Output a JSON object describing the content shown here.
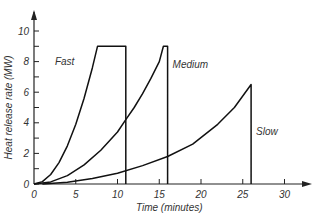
{
  "chart_data": {
    "type": "line",
    "title": "",
    "xlabel": "Time (minutes)",
    "ylabel": "Heat release rate (MW)",
    "xlim": [
      0,
      33
    ],
    "ylim": [
      0,
      11
    ],
    "x_ticks": [
      0,
      5,
      10,
      15,
      20,
      25,
      30
    ],
    "x_tick_labels": [
      "0",
      "5",
      "10",
      "15",
      "20",
      "25",
      "30"
    ],
    "y_ticks": [
      0,
      2,
      4,
      6,
      8,
      10
    ],
    "y_tick_labels": [
      "0",
      "2",
      "4",
      "6",
      "8",
      "10"
    ],
    "y_minor_ticks": [
      1,
      3,
      5,
      7,
      9
    ],
    "grid": false,
    "legend": "inline labels",
    "series": [
      {
        "name": "Fast",
        "label_pos": {
          "x": 2.5,
          "y": 7.8
        },
        "x": [
          0,
          1,
          2,
          3,
          4,
          5,
          6,
          7,
          7.6,
          11,
          11
        ],
        "values": [
          0,
          0.16,
          0.62,
          1.4,
          2.5,
          3.9,
          5.6,
          7.6,
          9,
          9,
          0
        ]
      },
      {
        "name": "Medium",
        "label_pos": {
          "x": 16.6,
          "y": 7.6
        },
        "x": [
          0,
          2,
          4,
          6,
          8,
          10,
          11,
          12,
          13,
          14,
          15,
          15.5,
          16,
          16
        ],
        "values": [
          0,
          0.14,
          0.55,
          1.25,
          2.2,
          3.4,
          4.2,
          5.0,
          5.9,
          6.9,
          8.0,
          9,
          9,
          0
        ]
      },
      {
        "name": "Slow",
        "label_pos": {
          "x": 26.6,
          "y": 3.2
        },
        "x": [
          1,
          4,
          7,
          10,
          13,
          16,
          19,
          22,
          24,
          26,
          26
        ],
        "values": [
          0,
          0.12,
          0.35,
          0.7,
          1.2,
          1.8,
          2.6,
          3.9,
          5.0,
          6.5,
          0
        ]
      }
    ],
    "annotations": [
      "Fast",
      "Medium",
      "Slow"
    ]
  }
}
